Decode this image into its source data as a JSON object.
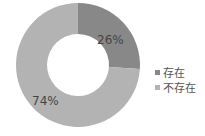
{
  "chart_data": {
    "type": "pie",
    "subtype": "donut",
    "title": "",
    "categories": [
      "存在",
      "不存在"
    ],
    "values": [
      26,
      74
    ],
    "labels": [
      "26%",
      "74%"
    ],
    "colors": [
      "#888888",
      "#b3b3b3"
    ],
    "legend_position": "right"
  },
  "legend": {
    "items": [
      {
        "label": "存在",
        "color": "#888888"
      },
      {
        "label": "不存在",
        "color": "#b3b3b3"
      }
    ]
  }
}
